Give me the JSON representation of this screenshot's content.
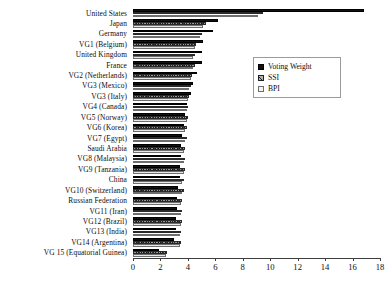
{
  "chart_data": {
    "type": "bar",
    "orientation": "horizontal",
    "title": "",
    "xlabel": "",
    "ylabel": "",
    "xlim": [
      0,
      18
    ],
    "x_ticks": [
      0,
      2,
      4,
      6,
      8,
      10,
      12,
      14,
      16,
      18
    ],
    "grid": false,
    "legend_position": "top-right",
    "categories": [
      "United States",
      "Japan",
      "Germany",
      "VG1 (Belgium)",
      "United Kingdom",
      "France",
      "VG2 (Netherlands)",
      "VG3 (Mexico)",
      "VG3 (Italy)",
      "VG4 (Canada)",
      "VG5 (Norway)",
      "VG6 (Korea)",
      "VG7 (Egypt)",
      "Saudi Arabia",
      "VG8 (Malaysia)",
      "VG9 (Tanzania)",
      "China",
      "VG10 (Switzerland)",
      "Russian Federation",
      "VG11 (Iran)",
      "VG12 (Brazil)",
      "VG13 (India)",
      "VG14 (Argentina)",
      "VG 15 (Equatorial Guinea)"
    ],
    "series": [
      {
        "name": "Voting Weight",
        "color": "#111111",
        "values": [
          16.8,
          6.2,
          5.8,
          5.1,
          5.0,
          5.0,
          4.7,
          4.4,
          4.2,
          3.9,
          3.8,
          3.7,
          3.6,
          3.5,
          3.5,
          3.4,
          3.4,
          3.3,
          3.2,
          3.2,
          3.1,
          3.1,
          3.0,
          1.9
        ]
      },
      {
        "name": "SSI",
        "color": "#9a9a9a",
        "values": [
          9.5,
          5.3,
          5.0,
          4.6,
          4.5,
          4.5,
          4.3,
          4.2,
          4.1,
          4.0,
          4.0,
          3.9,
          3.9,
          3.8,
          3.8,
          3.8,
          3.7,
          3.7,
          3.6,
          3.6,
          3.6,
          3.5,
          3.5,
          2.5
        ]
      },
      {
        "name": "BPI",
        "color": "#e9e9e9",
        "values": [
          9.1,
          5.1,
          4.9,
          4.5,
          4.4,
          4.4,
          4.2,
          4.1,
          4.0,
          3.9,
          3.9,
          3.8,
          3.8,
          3.7,
          3.7,
          3.7,
          3.6,
          3.6,
          3.5,
          3.5,
          3.5,
          3.4,
          3.4,
          2.4
        ]
      }
    ]
  },
  "legend": {
    "items": [
      {
        "label": "Voting Weight",
        "key": "vw"
      },
      {
        "label": "SSI",
        "key": "ssi"
      },
      {
        "label": "BPI",
        "key": "bpi"
      }
    ]
  }
}
